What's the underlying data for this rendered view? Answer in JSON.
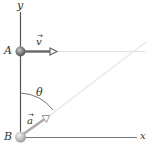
{
  "diagram": {
    "axes": {
      "x_label": "x",
      "y_label": "y"
    },
    "points": [
      {
        "label": "A",
        "description": "particle at top of y-axis"
      },
      {
        "label": "B",
        "description": "particle at origin"
      }
    ],
    "vectors": [
      {
        "label": "v",
        "arrow_glyph": "→",
        "from": "A",
        "direction": "+x"
      },
      {
        "label": "a",
        "arrow_glyph": "→",
        "from": "B",
        "direction": "up-right at angle θ from vertical"
      }
    ],
    "angle": {
      "label": "θ",
      "between": "y-axis and direction of a"
    },
    "colors": {
      "axis": "#555555",
      "arrow": "#666666",
      "faded_line": "#dddddd",
      "ball": "#8a8a8a"
    }
  }
}
